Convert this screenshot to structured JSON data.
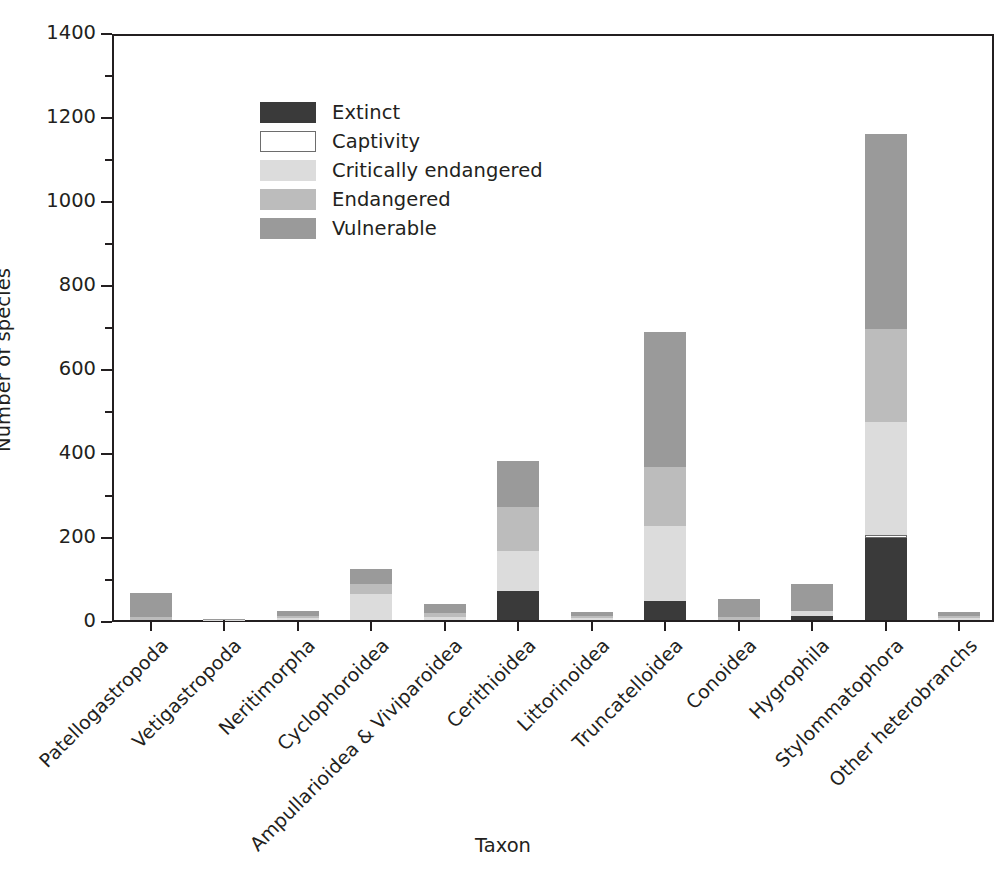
{
  "chart_data": {
    "type": "bar",
    "subtype": "stacked-bar",
    "title": "",
    "xlabel": "Taxon",
    "ylabel": "Number of species",
    "ylim": [
      0,
      1400
    ],
    "ytick_step": 200,
    "yticks": [
      0,
      200,
      400,
      600,
      800,
      1000,
      1200,
      1400
    ],
    "ytick_labels": [
      "0",
      "200",
      "400",
      "600",
      "800",
      "1000",
      "1200",
      "1400"
    ],
    "minor_ticks": true,
    "grid": false,
    "legend_position": "upper left",
    "categories": [
      "Patellogastropoda",
      "Vetigastropoda",
      "Neritimorpha",
      "Cyclophoroidea",
      "Ampullarioidea & Viviparoidea",
      "Cerithioidea",
      "Littorinoidea",
      "Truncatelloidea",
      "Conoidea",
      "Hygrophila",
      "Stylommatophora",
      "Other heterobranchs"
    ],
    "series": [
      {
        "name": "Extinct",
        "color": "#3a3a3a",
        "values": [
          0,
          0,
          0,
          0,
          0,
          70,
          0,
          45,
          0,
          10,
          196,
          0
        ]
      },
      {
        "name": "Captivity",
        "color": "#ffffff",
        "values": [
          0,
          0,
          0,
          0,
          0,
          0,
          0,
          0,
          0,
          0,
          6,
          0
        ]
      },
      {
        "name": "Critically endangered",
        "color": "#dcdcdc",
        "values": [
          0,
          1,
          4,
          62,
          6,
          95,
          4,
          180,
          0,
          12,
          270,
          4
        ]
      },
      {
        "name": "Endangered",
        "color": "#bcbcbc",
        "values": [
          8,
          0,
          6,
          23,
          10,
          105,
          6,
          140,
          8,
          0,
          220,
          6
        ]
      },
      {
        "name": "Vulnerable",
        "color": "#9a9a9a",
        "values": [
          57,
          1,
          12,
          37,
          22,
          108,
          10,
          320,
          42,
          63,
          466,
          10
        ]
      }
    ],
    "totals": [
      65,
      2,
      22,
      122,
      38,
      378,
      20,
      685,
      50,
      85,
      1158,
      20
    ]
  },
  "legend": {
    "items": [
      {
        "label": "Extinct",
        "swatch": "swatch-extinct"
      },
      {
        "label": "Captivity",
        "swatch": "swatch-captivity"
      },
      {
        "label": "Critically endangered",
        "swatch": "swatch-critical"
      },
      {
        "label": "Endangered",
        "swatch": "swatch-endangered"
      },
      {
        "label": "Vulnerable",
        "swatch": "swatch-vulnerable"
      }
    ]
  }
}
